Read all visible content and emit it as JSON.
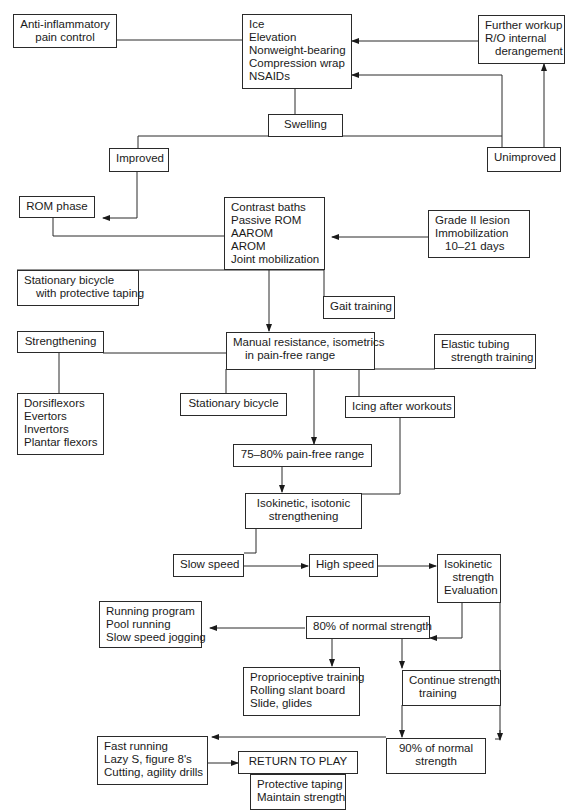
{
  "diagram": {
    "type": "flowchart",
    "nodes": {
      "anti_inflammatory": [
        "Anti-inflammatory",
        "pain control"
      ],
      "ice_block": [
        "Ice",
        "Elevation",
        "Nonweight-bearing",
        "Compression wrap",
        "NSAIDs"
      ],
      "further_workup": [
        "Further workup",
        "R/O internal",
        "derangement"
      ],
      "swelling": [
        "Swelling"
      ],
      "improved": [
        "Improved"
      ],
      "unimproved": [
        "Unimproved"
      ],
      "rom_phase": [
        "ROM phase"
      ],
      "contrast_block": [
        "Contrast baths",
        "Passive ROM",
        "AAROM",
        "AROM",
        "Joint mobilization"
      ],
      "grade2": [
        "Grade II lesion",
        "Immobilization",
        "10–21 days"
      ],
      "stationary_taping": [
        "Stationary bicycle",
        "with protective taping"
      ],
      "gait": [
        "Gait training"
      ],
      "strengthening": [
        "Strengthening"
      ],
      "manual_resistance": [
        "Manual resistance, isometrics",
        "in pain-free range"
      ],
      "elastic_tubing": [
        "Elastic tubing",
        "strength training"
      ],
      "muscles": [
        "Dorsiflexors",
        "Evertors",
        "Invertors",
        "Plantar flexors"
      ],
      "stationary_bicycle": [
        "Stationary bicycle"
      ],
      "icing": [
        "Icing after workouts"
      ],
      "pain_free_75": [
        "75–80% pain-free range"
      ],
      "isokinetic_isotonic": [
        "Isokinetic, isotonic",
        "strengthening"
      ],
      "slow_speed": [
        "Slow speed"
      ],
      "high_speed": [
        "High speed"
      ],
      "isokinetic_eval": [
        "Isokinetic",
        "strength",
        "Evaluation"
      ],
      "running_program": [
        "Running program",
        "Pool running",
        "Slow speed jogging"
      ],
      "normal_80": [
        "80% of normal strength"
      ],
      "proprioceptive": [
        "Proprioceptive training",
        "Rolling slant board",
        "Slide, glides"
      ],
      "continue_strength": [
        "Continue strength",
        "training"
      ],
      "normal_90": [
        "90% of normal",
        "strength"
      ],
      "fast_running": [
        "Fast running",
        "Lazy S, figure 8's",
        "Cutting, agility drills"
      ],
      "return_to_play": [
        "RETURN TO PLAY"
      ],
      "maintain": [
        "Protective taping",
        "Maintain strength"
      ]
    },
    "edges": [
      {
        "from": "anti_inflammatory",
        "to": "ice_block"
      },
      {
        "from": "further_workup",
        "to": "ice_block",
        "arrow": true
      },
      {
        "from": "unimproved",
        "to": "ice_block",
        "arrow": true
      },
      {
        "from": "unimproved",
        "to": "further_workup",
        "arrow": true
      },
      {
        "from": "ice_block",
        "to": "swelling"
      },
      {
        "from": "swelling",
        "to": "improved"
      },
      {
        "from": "swelling",
        "to": "unimproved"
      },
      {
        "from": "improved",
        "to": "rom_phase",
        "arrow": true
      },
      {
        "from": "rom_phase",
        "to": "contrast_block"
      },
      {
        "from": "grade2",
        "to": "contrast_block",
        "arrow": true
      },
      {
        "from": "contrast_block",
        "to": "stationary_taping"
      },
      {
        "from": "contrast_block",
        "to": "gait"
      },
      {
        "from": "contrast_block",
        "to": "manual_resistance",
        "arrow": true
      },
      {
        "from": "strengthening",
        "to": "manual_resistance"
      },
      {
        "from": "strengthening",
        "to": "muscles"
      },
      {
        "from": "manual_resistance",
        "to": "elastic_tubing"
      },
      {
        "from": "manual_resistance",
        "to": "stationary_bicycle"
      },
      {
        "from": "manual_resistance",
        "to": "icing"
      },
      {
        "from": "manual_resistance",
        "to": "pain_free_75",
        "arrow": true
      },
      {
        "from": "icing",
        "to": "isokinetic_isotonic"
      },
      {
        "from": "pain_free_75",
        "to": "isokinetic_isotonic",
        "arrow": true
      },
      {
        "from": "isokinetic_isotonic",
        "to": "slow_speed"
      },
      {
        "from": "slow_speed",
        "to": "high_speed",
        "arrow": true
      },
      {
        "from": "high_speed",
        "to": "isokinetic_eval",
        "arrow": true
      },
      {
        "from": "isokinetic_eval",
        "to": "normal_80",
        "arrow": true
      },
      {
        "from": "isokinetic_eval",
        "to": "normal_90",
        "arrow": true
      },
      {
        "from": "normal_80",
        "to": "running_program",
        "arrow": true
      },
      {
        "from": "normal_80",
        "to": "proprioceptive",
        "arrow": true
      },
      {
        "from": "normal_80",
        "to": "continue_strength",
        "arrow": true
      },
      {
        "from": "continue_strength",
        "to": "normal_90",
        "arrow": true
      },
      {
        "from": "normal_90",
        "to": "fast_running",
        "arrow": true
      },
      {
        "from": "fast_running",
        "to": "return_to_play",
        "arrow": true
      },
      {
        "from": "return_to_play",
        "to": "maintain"
      }
    ]
  }
}
